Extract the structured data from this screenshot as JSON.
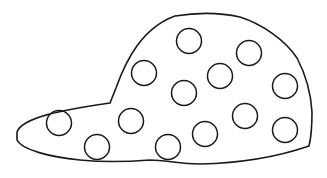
{
  "image": {
    "subject": "cap coloring outline with polka dots",
    "width": 327,
    "height": 178,
    "background": "#ffffff",
    "stroke_color": "#1a1a1a",
    "dot_count": 13
  },
  "cap": {
    "outline_path": "M17,132 C22,118 60,110 110,103 L116,88 C126,60 142,28 175,16 C200,12 222,13 240,17 C262,24 285,40 297,58 C306,75 311,95 312,112 C312,126 311,138 309,146 C280,156 245,163 200,164 C180,164 165,160 150,160 C125,162 100,162 80,160 C50,157 22,150 17,140 Z"
  },
  "dots": [
    {
      "cx": 189,
      "cy": 41,
      "r": 12.5
    },
    {
      "cx": 249,
      "cy": 53,
      "r": 12.5
    },
    {
      "cx": 144,
      "cy": 73,
      "r": 12.5
    },
    {
      "cx": 220,
      "cy": 76,
      "r": 12.5
    },
    {
      "cx": 285,
      "cy": 86,
      "r": 12.5
    },
    {
      "cx": 184,
      "cy": 93,
      "r": 12.5
    },
    {
      "cx": 59,
      "cy": 123,
      "r": 12.5
    },
    {
      "cx": 131,
      "cy": 121,
      "r": 12.5
    },
    {
      "cx": 245,
      "cy": 116,
      "r": 12.5
    },
    {
      "cx": 97,
      "cy": 147,
      "r": 12.5
    },
    {
      "cx": 205,
      "cy": 134,
      "r": 12.5
    },
    {
      "cx": 168,
      "cy": 147,
      "r": 12.5
    },
    {
      "cx": 285,
      "cy": 130,
      "r": 12.5
    }
  ]
}
